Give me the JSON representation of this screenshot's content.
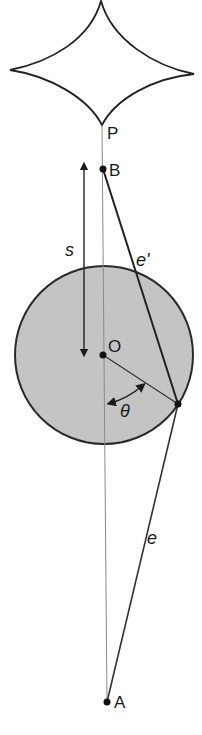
{
  "figure": {
    "colors": {
      "stroke": "#222222",
      "thin_line": "#8a8a8a",
      "circle_fill": "#c4c4c4"
    }
  },
  "labels": {
    "P": "P",
    "B": "B",
    "O": "O",
    "A": "A",
    "s": "s",
    "e_prime": "e'",
    "e": "e",
    "theta": "θ"
  }
}
